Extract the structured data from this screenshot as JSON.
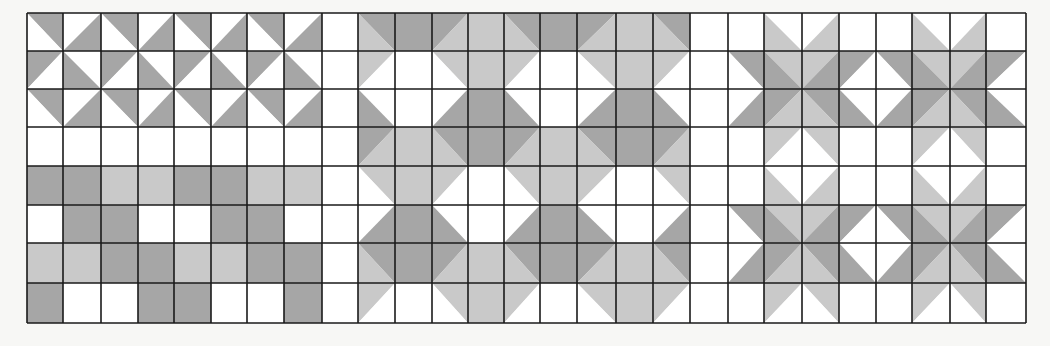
{
  "colors": {
    "W": "#ffffff",
    "D": "#a6a6a6",
    "L": "#c9c9c9",
    "line": "#1a1a1a",
    "background": "#f7f7f5"
  },
  "grid": {
    "x": 27,
    "y": 13,
    "cols": 27,
    "rows": 8,
    "col_edges": [
      27,
      63,
      101,
      138,
      174,
      211,
      247,
      284,
      322,
      358,
      395,
      432,
      468,
      504,
      540,
      577,
      616,
      653,
      690,
      728,
      764,
      802,
      839,
      876,
      912,
      950,
      986,
      1026
    ],
    "row_edges": [
      13,
      51,
      89,
      127,
      166,
      205,
      243,
      283,
      323
    ]
  },
  "sections": [
    {
      "name": "pinwheel-and-checker-section",
      "cols": [
        0,
        8
      ]
    },
    {
      "name": "hourglass-section",
      "cols": [
        9,
        17
      ]
    },
    {
      "name": "star-x-section",
      "cols": [
        18,
        26
      ]
    }
  ],
  "cell_legend": {
    "W": "white",
    "D": "dark gray",
    "L": "light gray",
    "\\:A,B": "split by diagonal from top-left to bottom-right; A = upper-right triangle, B = lower-left triangle",
    "/:A,B": "split by diagonal from bottom-left to top-right; A = upper-left triangle, B = lower-right triangle"
  },
  "cells": [
    [
      "\\:D,W",
      "/:W,D",
      "\\:D,W",
      "/:W,D",
      "\\:D,W",
      "/:W,D",
      "\\:D,W",
      "/:W,D",
      "W",
      "\\:D,L",
      "D",
      "/:D,L",
      "L",
      "\\:D,L",
      "D",
      "/:D,L",
      "L",
      "\\:D,L",
      "W",
      "W",
      "\\:W,L",
      "/:W,L",
      "W",
      "W",
      "\\:W,L",
      "/:W,L",
      "W"
    ],
    [
      "/:D,W",
      "\\:W,D",
      "/:D,W",
      "\\:W,D",
      "/:D,W",
      "\\:W,D",
      "/:D,W",
      "\\:W,D",
      "W",
      "/:L,W",
      "W",
      "\\:L,W",
      "L",
      "/:L,W",
      "W",
      "\\:L,W",
      "L",
      "/:L,W",
      "W",
      "\\:D,W",
      "\\:L,D",
      "/:L,D",
      "/:D,W",
      "\\:D,W",
      "\\:L,D",
      "/:L,D",
      "/:D,W"
    ],
    [
      "\\:D,W",
      "/:W,D",
      "\\:D,W",
      "/:W,D",
      "\\:D,W",
      "/:W,D",
      "\\:D,W",
      "/:W,D",
      "W",
      "\\:W,D",
      "W",
      "/:W,D",
      "D",
      "\\:W,D",
      "W",
      "/:W,D",
      "D",
      "\\:W,D",
      "W",
      "/:W,D",
      "/:D,L",
      "\\:D,L",
      "\\:W,D",
      "/:W,D",
      "/:D,L",
      "\\:D,L",
      "\\:W,D"
    ],
    [
      "W",
      "W",
      "W",
      "W",
      "W",
      "W",
      "W",
      "W",
      "W",
      "/:D,L",
      "L",
      "\\:D,L",
      "D",
      "/:D,L",
      "L",
      "\\:D,L",
      "D",
      "/:D,L",
      "W",
      "W",
      "/:L,W",
      "\\:L,W",
      "W",
      "W",
      "/:L,W",
      "\\:L,W",
      "W"
    ],
    [
      "D",
      "D",
      "L",
      "L",
      "D",
      "D",
      "L",
      "L",
      "W",
      "\\:L,W",
      "L",
      "/:L,W",
      "W",
      "\\:L,W",
      "L",
      "/:L,W",
      "W",
      "\\:L,W",
      "W",
      "W",
      "\\:W,L",
      "/:W,L",
      "W",
      "W",
      "\\:W,L",
      "/:W,L",
      "W"
    ],
    [
      "W",
      "D",
      "D",
      "W",
      "W",
      "D",
      "D",
      "W",
      "W",
      "/:W,D",
      "D",
      "\\:W,D",
      "W",
      "/:W,D",
      "D",
      "\\:W,D",
      "W",
      "/:W,D",
      "W",
      "\\:D,W",
      "\\:L,D",
      "/:L,D",
      "/:D,W",
      "\\:D,W",
      "\\:L,D",
      "/:L,D",
      "/:D,W"
    ],
    [
      "L",
      "L",
      "D",
      "D",
      "L",
      "L",
      "D",
      "D",
      "W",
      "\\:D,L",
      "D",
      "/:D,L",
      "L",
      "\\:D,L",
      "D",
      "/:D,L",
      "L",
      "\\:D,L",
      "W",
      "/:W,D",
      "/:D,L",
      "\\:D,L",
      "\\:W,D",
      "/:W,D",
      "/:D,L",
      "\\:D,L",
      "\\:W,D"
    ],
    [
      "D",
      "W",
      "W",
      "D",
      "D",
      "W",
      "W",
      "D",
      "W",
      "/:L,W",
      "W",
      "\\:L,W",
      "L",
      "/:L,W",
      "W",
      "\\:L,W",
      "L",
      "/:L,W",
      "W",
      "W",
      "/:L,W",
      "\\:L,W",
      "W",
      "W",
      "/:L,W",
      "\\:L,W",
      "W"
    ]
  ]
}
